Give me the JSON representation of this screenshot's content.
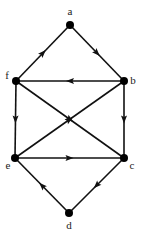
{
  "diagram": {
    "type": "directed-graph",
    "nodes": [
      {
        "id": "a",
        "label": "a",
        "x": 70,
        "y": 25,
        "lx": 70,
        "ly": 15
      },
      {
        "id": "b",
        "label": "b",
        "x": 124,
        "y": 81,
        "lx": 133,
        "ly": 84
      },
      {
        "id": "c",
        "label": "c",
        "x": 124,
        "y": 158,
        "lx": 132,
        "ly": 169
      },
      {
        "id": "d",
        "label": "d",
        "x": 69,
        "y": 213,
        "lx": 69,
        "ly": 229
      },
      {
        "id": "e",
        "label": "e",
        "x": 15,
        "y": 158,
        "lx": 8,
        "ly": 169
      },
      {
        "id": "f",
        "label": "f",
        "x": 16,
        "y": 81,
        "lx": 7,
        "ly": 79
      }
    ],
    "edges": [
      {
        "from": "f",
        "to": "a"
      },
      {
        "from": "a",
        "to": "b"
      },
      {
        "from": "b",
        "to": "f"
      },
      {
        "from": "f",
        "to": "c"
      },
      {
        "from": "e",
        "to": "b"
      },
      {
        "from": "f",
        "to": "e"
      },
      {
        "from": "b",
        "to": "c"
      },
      {
        "from": "e",
        "to": "c"
      },
      {
        "from": "c",
        "to": "d"
      },
      {
        "from": "d",
        "to": "e"
      }
    ]
  }
}
